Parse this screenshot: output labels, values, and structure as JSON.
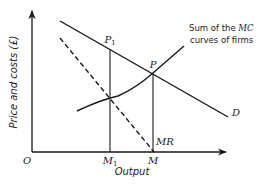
{
  "diagram": {
    "type": "economics-diagram",
    "axes": {
      "y_label": "Price and costs (£)",
      "x_label": "Output",
      "origin_label": "O"
    },
    "points": {
      "P": "P",
      "P1": "P",
      "P1_sub": "1",
      "M": "M",
      "M1": "M",
      "M1_sub": "1"
    },
    "curves": {
      "demand_label": "D",
      "mr_label": "MR",
      "mc_note_line1_pre": "Sum of the ",
      "mc_note_line1_em": "MC",
      "mc_note_line2": "curves of firms"
    },
    "colors": {
      "ink": "#1a1a1a",
      "background": "#ffffff"
    }
  }
}
